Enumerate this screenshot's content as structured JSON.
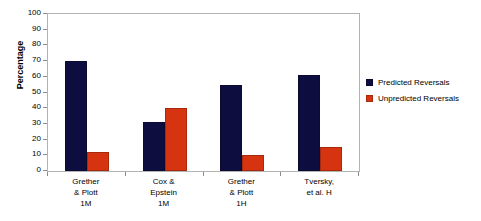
{
  "chart_data": {
    "type": "bar",
    "title": "",
    "xlabel": "",
    "ylabel": "Percentage",
    "ylim": [
      0,
      100
    ],
    "ytick_step": 10,
    "yticks": [
      100,
      90,
      80,
      70,
      60,
      50,
      40,
      30,
      20,
      10,
      0
    ],
    "grid": false,
    "legend_position": "right",
    "categories": [
      {
        "lines": [
          "Grether",
          "& Plott",
          "1M"
        ]
      },
      {
        "lines": [
          "Cox &",
          "Epstein",
          "1M"
        ]
      },
      {
        "lines": [
          "Grether",
          "& Plott",
          "1H"
        ]
      },
      {
        "lines": [
          "Tversky,",
          "et al. H"
        ]
      }
    ],
    "series": [
      {
        "name": "Predicted Reversals",
        "color": "#0d0d40",
        "values": [
          70,
          31,
          55,
          61
        ]
      },
      {
        "name": "Unpredicted Reversals",
        "color": "#d63410",
        "values": [
          12,
          40,
          10,
          15
        ]
      }
    ]
  },
  "legend": {
    "entries": [
      {
        "label": "Predicted Reversals"
      },
      {
        "label": "Unpredicted Reversals"
      }
    ]
  }
}
